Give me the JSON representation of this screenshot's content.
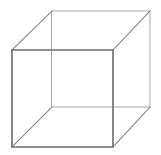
{
  "figure": {
    "name": "necker-cube",
    "background_color": "#ffffff",
    "canvas": {
      "width": 161,
      "height": 155
    },
    "caption": ""
  },
  "style": {
    "front_edge_color": "#6b6b6b",
    "back_edge_color": "#a8a8a8",
    "connector_edge_color": "#8d8d8d",
    "front_edge_width": 1.6,
    "back_edge_width": 1.0,
    "connector_edge_width": 1.2
  },
  "chart_data": {
    "type": "line",
    "xlabel": "",
    "ylabel": "",
    "grid": false,
    "legend": "none",
    "xlim": [
      0,
      161
    ],
    "ylim": [
      0,
      155
    ],
    "vertices": {
      "front_top_left": [
        12,
        50
      ],
      "front_top_right": [
        113,
        50
      ],
      "front_bottom_right": [
        113,
        147
      ],
      "front_bottom_left": [
        12,
        147
      ],
      "back_top_left": [
        52,
        11
      ],
      "back_top_right": [
        150,
        11
      ],
      "back_bottom_right": [
        150,
        107
      ],
      "back_bottom_left": [
        52,
        107
      ]
    },
    "series": [
      {
        "name": "front-face",
        "kind": "front",
        "closed": true,
        "points": [
          [
            12,
            50
          ],
          [
            113,
            50
          ],
          [
            113,
            147
          ],
          [
            12,
            147
          ]
        ]
      },
      {
        "name": "back-face",
        "kind": "back",
        "closed": true,
        "points": [
          [
            52,
            11
          ],
          [
            150,
            11
          ],
          [
            150,
            107
          ],
          [
            52,
            107
          ]
        ]
      },
      {
        "name": "connector-top-left",
        "kind": "connector",
        "closed": false,
        "points": [
          [
            12,
            50
          ],
          [
            52,
            11
          ]
        ]
      },
      {
        "name": "connector-top-right",
        "kind": "connector",
        "closed": false,
        "points": [
          [
            113,
            50
          ],
          [
            150,
            11
          ]
        ]
      },
      {
        "name": "connector-bottom-right",
        "kind": "connector",
        "closed": false,
        "points": [
          [
            113,
            147
          ],
          [
            150,
            107
          ]
        ]
      },
      {
        "name": "connector-bottom-left",
        "kind": "connector",
        "closed": false,
        "points": [
          [
            12,
            147
          ],
          [
            52,
            107
          ]
        ]
      }
    ]
  }
}
